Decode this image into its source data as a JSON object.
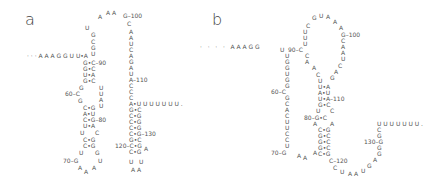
{
  "panel_a": {
    "label": "a",
    "nucleotides": [
      {
        "t": "· · · A A A G G U U•A",
        "x": 27,
        "y": 53
      },
      {
        "t": "G•C–90",
        "x": 83,
        "y": 60
      },
      {
        "t": "G•C",
        "x": 83,
        "y": 66
      },
      {
        "t": "U•A",
        "x": 83,
        "y": 72
      },
      {
        "t": "G•C",
        "x": 83,
        "y": 78
      },
      {
        "t": "U",
        "x": 85,
        "y": 25
      },
      {
        "t": "G",
        "x": 91,
        "y": 32
      },
      {
        "t": "C",
        "x": 91,
        "y": 39
      },
      {
        "t": "G",
        "x": 91,
        "y": 45
      },
      {
        "t": "U",
        "x": 91,
        "y": 51
      },
      {
        "t": "A",
        "x": 98,
        "y": 14
      },
      {
        "t": "A A",
        "x": 106,
        "y": 10
      },
      {
        "t": "G–100",
        "x": 123,
        "y": 13
      },
      {
        "t": "C",
        "x": 127,
        "y": 21
      },
      {
        "t": "A",
        "x": 129,
        "y": 29
      },
      {
        "t": "A",
        "x": 129,
        "y": 35
      },
      {
        "t": "U",
        "x": 129,
        "y": 41
      },
      {
        "t": "C",
        "x": 129,
        "y": 47
      },
      {
        "t": "A",
        "x": 129,
        "y": 53
      },
      {
        "t": "G",
        "x": 129,
        "y": 59
      },
      {
        "t": "A",
        "x": 129,
        "y": 65
      },
      {
        "t": "U",
        "x": 129,
        "y": 71
      },
      {
        "t": "A–110",
        "x": 129,
        "y": 77
      },
      {
        "t": "C",
        "x": 129,
        "y": 83
      },
      {
        "t": "C",
        "x": 129,
        "y": 89
      },
      {
        "t": "C",
        "x": 129,
        "y": 95
      },
      {
        "t": "A•U U U U U U U .",
        "x": 129,
        "y": 101
      },
      {
        "t": "G•C",
        "x": 129,
        "y": 107
      },
      {
        "t": "C•G",
        "x": 129,
        "y": 113
      },
      {
        "t": "C•G",
        "x": 129,
        "y": 119
      },
      {
        "t": "C•G",
        "x": 129,
        "y": 125
      },
      {
        "t": "C•G–130",
        "x": 129,
        "y": 131
      },
      {
        "t": "G•C",
        "x": 129,
        "y": 137
      },
      {
        "t": "120–C•G",
        "x": 115,
        "y": 143
      },
      {
        "t": "A",
        "x": 144,
        "y": 146
      },
      {
        "t": "C•G",
        "x": 129,
        "y": 149
      },
      {
        "t": "U   U",
        "x": 129,
        "y": 159
      },
      {
        "t": "A A",
        "x": 131,
        "y": 167
      },
      {
        "t": "U",
        "x": 99,
        "y": 85
      },
      {
        "t": "U",
        "x": 99,
        "y": 91
      },
      {
        "t": "A",
        "x": 99,
        "y": 97
      },
      {
        "t": "U",
        "x": 99,
        "y": 103
      },
      {
        "t": "G",
        "x": 79,
        "y": 85
      },
      {
        "t": "60–C",
        "x": 65,
        "y": 91
      },
      {
        "t": "G",
        "x": 78,
        "y": 98
      },
      {
        "t": "C•G",
        "x": 83,
        "y": 105
      },
      {
        "t": "A•U",
        "x": 83,
        "y": 111
      },
      {
        "t": "C•G–80",
        "x": 83,
        "y": 117
      },
      {
        "t": "U•A",
        "x": 83,
        "y": 123
      },
      {
        "t": "U",
        "x": 80,
        "y": 130
      },
      {
        "t": "C",
        "x": 95,
        "y": 130
      },
      {
        "t": "C•G",
        "x": 83,
        "y": 137
      },
      {
        "t": "C•G",
        "x": 83,
        "y": 143
      },
      {
        "t": "U",
        "x": 79,
        "y": 150
      },
      {
        "t": "G",
        "x": 95,
        "y": 150
      },
      {
        "t": "70–G",
        "x": 63,
        "y": 158
      },
      {
        "t": "U",
        "x": 98,
        "y": 158
      },
      {
        "t": "A",
        "x": 78,
        "y": 165
      },
      {
        "t": "A",
        "x": 84,
        "y": 169
      },
      {
        "t": "A",
        "x": 92,
        "y": 165
      }
    ]
  },
  "panel_b": {
    "label": "b",
    "nucleotides": [
      {
        "t": "·   ·   ·   ·   A A A G G",
        "x": 0,
        "y": 44
      },
      {
        "t": "U",
        "x": 80,
        "y": 47
      },
      {
        "t": "90–C",
        "x": 88,
        "y": 47
      },
      {
        "t": "U",
        "x": 85,
        "y": 53
      },
      {
        "t": "G",
        "x": 85,
        "y": 59
      },
      {
        "t": "G",
        "x": 85,
        "y": 65
      },
      {
        "t": "U",
        "x": 85,
        "y": 71
      },
      {
        "t": "G",
        "x": 85,
        "y": 77
      },
      {
        "t": "G",
        "x": 85,
        "y": 83
      },
      {
        "t": "60–C",
        "x": 71,
        "y": 89
      },
      {
        "t": "G",
        "x": 85,
        "y": 95
      },
      {
        "t": "C",
        "x": 85,
        "y": 101
      },
      {
        "t": "A",
        "x": 85,
        "y": 107
      },
      {
        "t": "C",
        "x": 85,
        "y": 113
      },
      {
        "t": "U",
        "x": 85,
        "y": 119
      },
      {
        "t": "U",
        "x": 85,
        "y": 125
      },
      {
        "t": "C",
        "x": 85,
        "y": 131
      },
      {
        "t": "C",
        "x": 85,
        "y": 137
      },
      {
        "t": "U",
        "x": 85,
        "y": 143
      },
      {
        "t": "70–G",
        "x": 71,
        "y": 150
      },
      {
        "t": "A",
        "x": 97,
        "y": 153
      },
      {
        "t": "A",
        "x": 103,
        "y": 155
      },
      {
        "t": "A",
        "x": 113,
        "y": 150
      },
      {
        "t": "C",
        "x": 105,
        "y": 53
      },
      {
        "t": "A",
        "x": 105,
        "y": 59
      },
      {
        "t": "U",
        "x": 103,
        "y": 41
      },
      {
        "t": "U",
        "x": 103,
        "y": 35
      },
      {
        "t": "U",
        "x": 103,
        "y": 29
      },
      {
        "t": "C",
        "x": 106,
        "y": 23
      },
      {
        "t": "G",
        "x": 112,
        "y": 15
      },
      {
        "t": "U",
        "x": 119,
        "y": 13
      },
      {
        "t": "A",
        "x": 126,
        "y": 14
      },
      {
        "t": "A",
        "x": 133,
        "y": 19
      },
      {
        "t": "A",
        "x": 139,
        "y": 25
      },
      {
        "t": "G–100",
        "x": 141,
        "y": 32
      },
      {
        "t": "C",
        "x": 141,
        "y": 38
      },
      {
        "t": "A",
        "x": 141,
        "y": 44
      },
      {
        "t": "A",
        "x": 141,
        "y": 50
      },
      {
        "t": "U",
        "x": 141,
        "y": 56
      },
      {
        "t": "C",
        "x": 138,
        "y": 63
      },
      {
        "t": "A",
        "x": 134,
        "y": 69
      },
      {
        "t": "G",
        "x": 130,
        "y": 75
      },
      {
        "t": "A",
        "x": 112,
        "y": 65
      },
      {
        "t": "C",
        "x": 116,
        "y": 72
      },
      {
        "t": "U",
        "x": 118,
        "y": 78
      },
      {
        "t": "U•A",
        "x": 118,
        "y": 84
      },
      {
        "t": "A•U",
        "x": 118,
        "y": 90
      },
      {
        "t": "U•A–110",
        "x": 118,
        "y": 96
      },
      {
        "t": "G•C",
        "x": 118,
        "y": 102
      },
      {
        "t": "U",
        "x": 116,
        "y": 108
      },
      {
        "t": "C",
        "x": 130,
        "y": 108
      },
      {
        "t": "80–G•C",
        "x": 104,
        "y": 115
      },
      {
        "t": "A",
        "x": 113,
        "y": 121
      },
      {
        "t": "A",
        "x": 130,
        "y": 121
      },
      {
        "t": "C•G",
        "x": 118,
        "y": 127
      },
      {
        "t": "G•C",
        "x": 118,
        "y": 133
      },
      {
        "t": "G•C",
        "x": 118,
        "y": 139
      },
      {
        "t": "G•C",
        "x": 118,
        "y": 145
      },
      {
        "t": "C•G",
        "x": 118,
        "y": 151
      },
      {
        "t": "C–120",
        "x": 129,
        "y": 158
      },
      {
        "t": "C",
        "x": 133,
        "y": 165
      },
      {
        "t": "U",
        "x": 140,
        "y": 169
      },
      {
        "t": "A",
        "x": 148,
        "y": 171
      },
      {
        "t": "A",
        "x": 154,
        "y": 171
      },
      {
        "t": "U",
        "x": 161,
        "y": 168
      },
      {
        "t": "G",
        "x": 167,
        "y": 163
      },
      {
        "t": "A",
        "x": 173,
        "y": 157
      },
      {
        "t": "G",
        "x": 177,
        "y": 151
      },
      {
        "t": "G",
        "x": 177,
        "y": 145
      },
      {
        "t": "130–G",
        "x": 164,
        "y": 139
      },
      {
        "t": "G",
        "x": 177,
        "y": 133
      },
      {
        "t": "C",
        "x": 177,
        "y": 127
      },
      {
        "t": "U U U U U U U .",
        "x": 177,
        "y": 121
      }
    ]
  }
}
